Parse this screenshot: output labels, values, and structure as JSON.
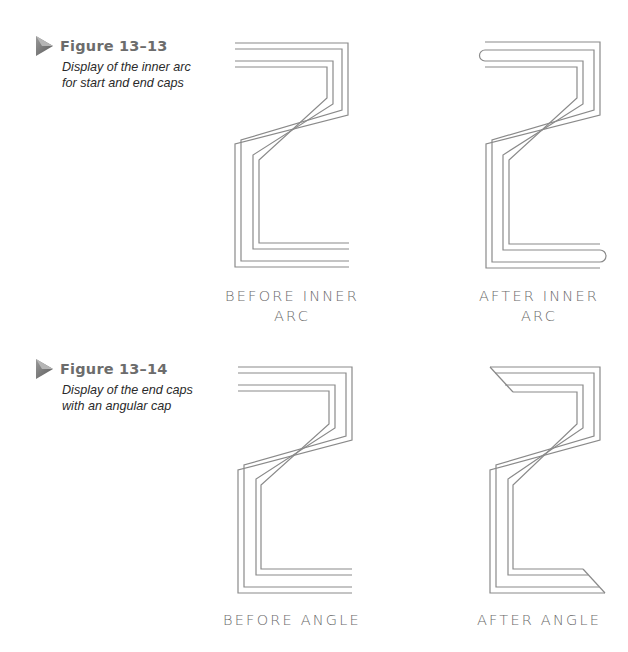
{
  "figures": [
    {
      "number": "Figure 13–13",
      "description_lines": [
        "Display of the inner arc",
        "for start and end caps"
      ],
      "panels": [
        {
          "label_lines": [
            "BEFORE INNER",
            "ARC"
          ],
          "cap_style": "none"
        },
        {
          "label_lines": [
            "AFTER INNER",
            "ARC"
          ],
          "cap_style": "inner-arc"
        }
      ]
    },
    {
      "number": "Figure 13–14",
      "description_lines": [
        "Display of the end caps",
        "with an angular cap"
      ],
      "panels": [
        {
          "label_lines": [
            "BEFORE ANGLE"
          ],
          "cap_style": "none"
        },
        {
          "label_lines": [
            "AFTER ANGLE"
          ],
          "cap_style": "angle"
        }
      ]
    }
  ],
  "colors": {
    "line": "#8a8a8a",
    "figure_number": "#6c6c6c",
    "description": "#2a2a2a",
    "label": "#6a6a6a",
    "arrow": "#7a7a7a"
  }
}
